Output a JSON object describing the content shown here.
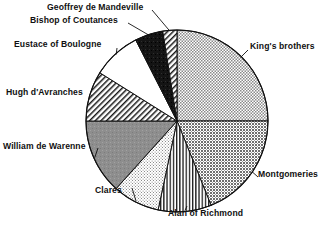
{
  "chart_data": {
    "type": "pie",
    "title": "",
    "subtitle": "",
    "xlabel": "",
    "ylabel": "",
    "legend_position": "none",
    "grid": false,
    "labels_placement": "outside-with-leader-lines",
    "center": {
      "cx": 177,
      "cy": 121,
      "r": 91
    },
    "start_angle_deg": 0,
    "direction": "clockwise",
    "categories": [
      "King's brothers",
      "Montgomeries",
      "Alan of Richmond",
      "Clares",
      "William de Warenne",
      "Hugh d'Avranches",
      "Eustace of Boulogne",
      "Bishop of Coutances",
      "Geoffrey de Mandeville"
    ],
    "values": [
      25.0,
      19.0,
      9.5,
      8.5,
      13.0,
      9.0,
      8.5,
      5.0,
      2.5
    ],
    "slices": [
      {
        "label": "King's brothers",
        "value": 25.0,
        "start_deg": 0,
        "end_deg": 90,
        "fill": "stipple-fine",
        "color": "#b4b4b4"
      },
      {
        "label": "Montgomeries",
        "value": 19.0,
        "start_deg": 90,
        "end_deg": 158,
        "fill": "stipple-medium",
        "color": "#9a9a9a"
      },
      {
        "label": "Alan of Richmond",
        "value": 9.5,
        "start_deg": 158,
        "end_deg": 192,
        "fill": "vertical-stripes",
        "color": "#ffffff"
      },
      {
        "label": "Clares",
        "value": 8.5,
        "start_deg": 192,
        "end_deg": 222,
        "fill": "stipple-light",
        "color": "#e2e2e2"
      },
      {
        "label": "William de Warenne",
        "value": 13.0,
        "start_deg": 222,
        "end_deg": 270,
        "fill": "solid-gray",
        "color": "#8e8e8e"
      },
      {
        "label": "Hugh d'Avranches",
        "value": 9.0,
        "start_deg": 270,
        "end_deg": 302,
        "fill": "diagonal-hatch",
        "color": "#ffffff"
      },
      {
        "label": "Eustace of Boulogne",
        "value": 8.5,
        "start_deg": 302,
        "end_deg": 333,
        "fill": "white",
        "color": "#ffffff"
      },
      {
        "label": "Bishop of Coutances",
        "value": 5.0,
        "start_deg": 333,
        "end_deg": 351,
        "fill": "black",
        "color": "#111111"
      },
      {
        "label": "Geoffrey de Mandeville",
        "value": 2.5,
        "start_deg": 351,
        "end_deg": 360,
        "fill": "diagonal-hatch",
        "color": "#ffffff"
      }
    ],
    "stroke_color": "#111111"
  }
}
